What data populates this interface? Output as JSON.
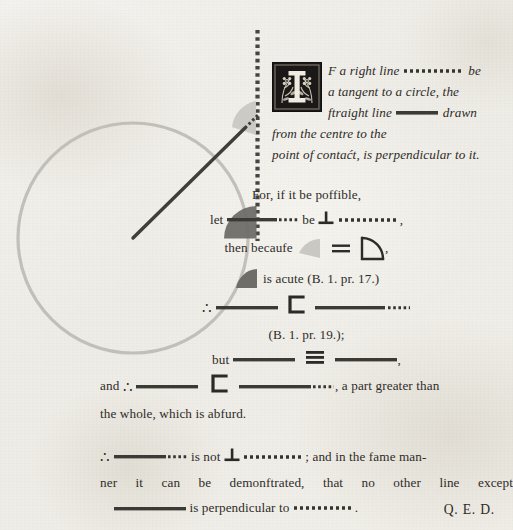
{
  "page": {
    "background_hex": "#f1efe9",
    "ink_hex": "#2e2c29",
    "width": 513,
    "height": 530
  },
  "colors": {
    "line_dark": "#3a3936",
    "line_dotted": "#33322f",
    "circle_gray": "#bdbcb6",
    "angle_dark": "#6f6e69",
    "angle_light": "#c6c5bf",
    "initial_bg": "#1d1b19"
  },
  "enunciation": {
    "drop_cap": "I",
    "drop_cap_icon": "floral-woodcut-initial",
    "line1_a": "F a right line",
    "line1_b": "be",
    "line2": "a tangent to a circle, the",
    "line3_a": "ftraight line",
    "line3_b": "drawn",
    "line4": "from the centre to the",
    "line5": "point of contaćt, is perpendicular to it."
  },
  "proof": {
    "l1": "For, if it be poffible,",
    "l2_a": "let",
    "l2_b": "be",
    "l2_c": ",",
    "l3_a": "then becaufe",
    "l3_b": ",",
    "l4_a": "is acute",
    "l4_b": "(B. 1. pr. 17.)",
    "l5_a": "∴",
    "l5_b": "",
    "l6": "(B. 1. pr. 19.);",
    "l7_a": "but",
    "l7_b": ",",
    "l8_a": "and",
    "l8_b": "∴",
    "l8_c": ", a part greater than",
    "l9": "the whole, which is abfurd.",
    "l10_a": "∴",
    "l10_b": "is not",
    "l10_c": "; and in the fame man-",
    "l11": "ner it can be demonftrated, that no other line except",
    "l12_a": "is perpendicular to",
    "l12_b": "."
  },
  "symbols": {
    "perpendicular": "⊥",
    "therefore": "∴",
    "less_than_bracket": "⊐",
    "equals": "=",
    "identical": "≡"
  },
  "qed": "Q. E. D.",
  "diagram": {
    "center_x": 133,
    "center_y": 238,
    "circle_radius": 115,
    "tangent_x": 257,
    "tangent_top_y": 30,
    "tangent_bottom_y": 240,
    "radius_end_x": 257,
    "radius_end_y": 238,
    "oblique_end_x": 257,
    "oblique_end_y": 118,
    "right_angle_label": "right-angle-marker",
    "acute_angle_label": "acute-angle-marker"
  }
}
